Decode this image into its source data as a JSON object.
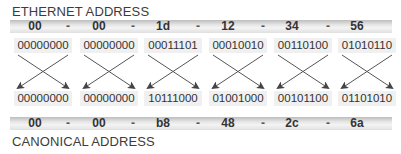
{
  "titles": {
    "top": "ETHERNET ADDRESS",
    "bottom": "CANONICAL ADDRESS"
  },
  "separator": "-",
  "ethernet": {
    "hex": [
      "00",
      "00",
      "1d",
      "12",
      "34",
      "56"
    ],
    "binary": [
      "00000000",
      "00000000",
      "00011101",
      "00010010",
      "00110100",
      "01010110"
    ]
  },
  "canonical": {
    "hex": [
      "00",
      "00",
      "b8",
      "48",
      "2c",
      "6a"
    ],
    "binary": [
      "00000000",
      "00000000",
      "10111000",
      "01001000",
      "00101100",
      "01101010"
    ]
  },
  "colors": {
    "text": "#333333",
    "band": "#d8d8d8",
    "box": "#f0f0f0",
    "arrow": "#555555"
  }
}
